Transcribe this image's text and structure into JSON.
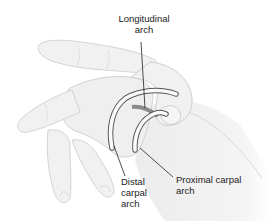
{
  "figure": {
    "labels": {
      "longitudinal": {
        "line1": "Longitudinal",
        "line2": "arch"
      },
      "distal": {
        "line1": "Distal",
        "line2": "carpal",
        "line3": "arch"
      },
      "proximal": {
        "line1": "Proximal carpal",
        "line2": "arch"
      }
    },
    "colors": {
      "skin_fill": "#f0f0f0",
      "skin_outline": "#c8c8c8",
      "arch_fill": "#fafafa",
      "arch_outline": "#555555",
      "arch_band": "#8a8a8a",
      "leader_line": "#222222",
      "text": "#222222"
    }
  }
}
